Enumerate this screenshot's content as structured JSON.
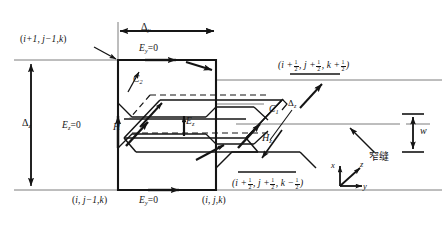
{
  "figure": {
    "ink_color": "#141414",
    "grid_color": "#6e6e6e"
  },
  "labels": {
    "delta_y": {
      "text": "Δ",
      "sub": "y"
    },
    "delta_z_left": {
      "text": "Δ",
      "sub": "z"
    },
    "delta_z_right": {
      "text": "Δ",
      "sub": "z"
    },
    "w": {
      "text": "w"
    },
    "Ey_top": {
      "text": "E",
      "sub": "y",
      "eq": "=0"
    },
    "Ey_bottom": {
      "text": "E",
      "sub": "y",
      "eq": "=0"
    },
    "Ez_left": {
      "text": "E",
      "sub": "z",
      "eq": "=0"
    },
    "Ez_center": {
      "text": "E",
      "sub": "z"
    },
    "H_left": {
      "text": "H"
    },
    "Hz_right": {
      "text": "H",
      "sub": "z"
    },
    "C1": {
      "text": "C",
      "sub": "1"
    },
    "C2": {
      "text": "C",
      "sub": "2"
    },
    "slit": {
      "text": "窄缝"
    },
    "axis_x": {
      "text": "x"
    },
    "axis_y": {
      "text": "y"
    },
    "axis_z": {
      "text": "z"
    }
  },
  "node_labels": {
    "top_left": {
      "prefix": "(",
      "i": "i+1",
      "sep1": ", ",
      "j": "j−1",
      "sep2": ",",
      "k": "k",
      "suffix": ")"
    },
    "bottom_left": {
      "prefix": "(",
      "i": "i",
      "sep1": ", ",
      "j": "j−1",
      "sep2": ",",
      "k": "k",
      "suffix": ")"
    },
    "bottom_center": {
      "prefix": "(",
      "i": "i",
      "sep1": ", ",
      "j": "j",
      "sep2": ",",
      "k": "k",
      "suffix": ")"
    },
    "upper_right": {
      "text_parts": [
        "(i +",
        "1/2",
        ", j +",
        "1/2",
        ", k +",
        "1/2",
        ")"
      ]
    },
    "lower_right": {
      "text_parts": [
        "(i +",
        "1/2",
        ", j +",
        "1/2",
        ", k −",
        "1/2",
        ")"
      ]
    }
  }
}
